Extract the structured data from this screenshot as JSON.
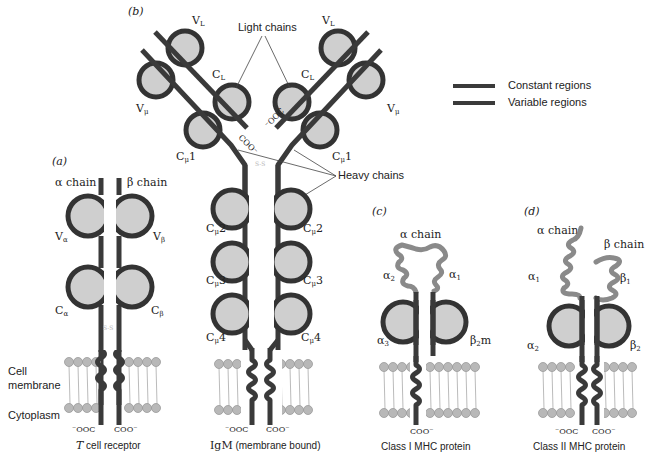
{
  "figure": {
    "panels": [
      {
        "id": "a",
        "panel_label": "(a)",
        "caption": "T cell receptor",
        "caption_italic_part": "T",
        "caption_rest": " cell receptor",
        "chain_labels": [
          "α chain",
          "β chain"
        ],
        "domain_labels": [
          "Vα",
          "Vβ",
          "Cα",
          "Cβ"
        ],
        "disulfide": "S-S",
        "termini": [
          "⁻OOC",
          "COO⁻"
        ]
      },
      {
        "id": "b",
        "panel_label": "(b)",
        "caption": "IgM (membrane bound)",
        "caption_main": "IgM",
        "caption_rest": " (membrane bound)",
        "domain_labels": [
          "VL",
          "VL",
          "Vμ",
          "Vμ",
          "CL",
          "CL",
          "Cμ1",
          "Cμ1",
          "Cμ2",
          "Cμ2",
          "Cμ3",
          "Cμ3",
          "Cμ4",
          "Cμ4"
        ],
        "callouts": [
          "Light chains",
          "Heavy chains"
        ],
        "disulfide": "S-S",
        "termini": [
          "⁻OOC",
          "COO⁻",
          "⁻OOC",
          "COO⁻"
        ]
      },
      {
        "id": "c",
        "panel_label": "(c)",
        "caption": "Class I MHC protein",
        "chain_labels": [
          "α chain"
        ],
        "domain_labels": [
          "α2",
          "α1",
          "α3",
          "β2m"
        ],
        "termini": [
          "COO⁻"
        ]
      },
      {
        "id": "d",
        "panel_label": "(d)",
        "caption": "Class II MHC protein",
        "chain_labels": [
          "α chain",
          "β chain"
        ],
        "domain_labels": [
          "α1",
          "β1",
          "α2",
          "β2"
        ],
        "termini": [
          "⁻OOC",
          "COO⁻"
        ]
      }
    ],
    "side_labels": {
      "membrane": "Cell membrane",
      "membrane_line1": "Cell",
      "membrane_line2": "membrane",
      "cytoplasm": "Cytoplasm"
    },
    "legend": {
      "items": [
        {
          "label": "Constant regions",
          "color": "#3a3a3a"
        },
        {
          "label": "Variable regions",
          "color": "#3a3a3a"
        }
      ]
    },
    "colors": {
      "chain": "#3a3a3a",
      "domain_fill": "#cfcfcf",
      "mhc_variable": "#8a8a8a",
      "disulfide": "#bbbbbb",
      "lipid_head": "#b8b8b8"
    },
    "text": {
      "a_label": "(a)",
      "b_label": "(b)",
      "c_label": "(c)",
      "d_label": "(d)",
      "alpha_chain": "α chain",
      "beta_chain": "β chain",
      "V": "V",
      "C": "C",
      "sub_alpha": "α",
      "sub_beta": "β",
      "sub_L": "L",
      "sub_mu": "μ",
      "n1": "1",
      "n2": "2",
      "n3": "3",
      "n4": "4",
      "light_chains": "Light chains",
      "heavy_chains": "Heavy chains",
      "ooc": "⁻OOC",
      "coo": "COO⁻",
      "ss": "S-S",
      "s": "S",
      "alpha": "α",
      "beta": "β",
      "m": "m",
      "constant_regions": "Constant regions",
      "variable_regions": "Variable regions",
      "cell": "Cell",
      "membrane": "membrane",
      "cytoplasm": "Cytoplasm",
      "tcr_T": "T",
      "tcr_rest": " cell receptor",
      "igm_main": "IgM",
      "igm_rest": " (membrane bound)",
      "mhc1": "Class I MHC protein",
      "mhc2": "Class II MHC protein"
    }
  }
}
